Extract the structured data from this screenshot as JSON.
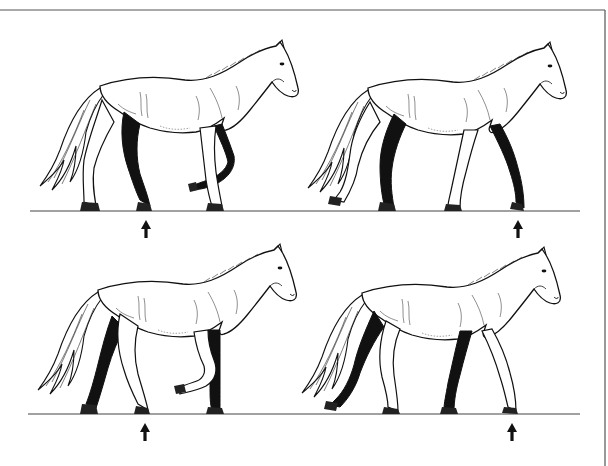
{
  "figure": {
    "kind": "horse-walk-gait-sequence",
    "width": 608,
    "height": 466,
    "background": "#ffffff",
    "ink": "#111111",
    "frame": {
      "top_y": 10,
      "right_x": 605,
      "color": "#555555"
    },
    "ground_lines": [
      {
        "row": 1,
        "y": 211,
        "x1": 30,
        "x2": 580,
        "color": "#444444"
      },
      {
        "row": 2,
        "y": 414,
        "x1": 28,
        "x2": 580,
        "color": "#444444"
      }
    ],
    "panels": [
      {
        "id": "top-left",
        "row": 1,
        "col": 1,
        "offset_x": 0,
        "offset_y": 0,
        "pose": "left-fore-raised",
        "arrow": {
          "x": 146,
          "y": 220,
          "label": "landing-hoof-arrow"
        }
      },
      {
        "id": "top-right",
        "row": 1,
        "col": 2,
        "offset_x": 270,
        "offset_y": 2,
        "pose": "left-hind-raised",
        "arrow": {
          "x": 518,
          "y": 220,
          "label": "landing-hoof-arrow"
        }
      },
      {
        "id": "bottom-left",
        "row": 2,
        "col": 1,
        "offset_x": 0,
        "offset_y": 204,
        "pose": "right-fore-raised",
        "arrow": {
          "x": 145,
          "y": 423,
          "label": "landing-hoof-arrow"
        }
      },
      {
        "id": "bottom-right",
        "row": 2,
        "col": 2,
        "offset_x": 270,
        "offset_y": 207,
        "pose": "right-hind-raised",
        "arrow": {
          "x": 512,
          "y": 423,
          "label": "landing-hoof-arrow"
        }
      }
    ]
  }
}
